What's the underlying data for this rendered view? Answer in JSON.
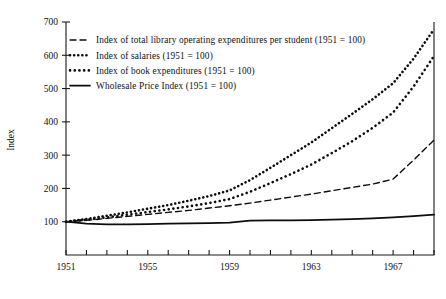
{
  "chart_data": {
    "type": "line",
    "title": "",
    "xlabel": "",
    "ylabel": "Index",
    "xlim": [
      1951,
      1969
    ],
    "ylim": [
      0,
      700
    ],
    "y_ticks": [
      100,
      200,
      300,
      400,
      500,
      600,
      700
    ],
    "x_ticks": [
      1951,
      1952,
      1953,
      1954,
      1955,
      1956,
      1957,
      1958,
      1959,
      1960,
      1961,
      1962,
      1963,
      1964,
      1965,
      1966,
      1967,
      1968,
      1969
    ],
    "x_tick_labels": [
      "1951",
      "",
      "",
      "",
      "1955",
      "",
      "",
      "",
      "1959",
      "",
      "",
      "",
      "1963",
      "",
      "",
      "",
      "1967",
      "",
      ""
    ],
    "grid": false,
    "legend_position": "upper-left",
    "x": [
      1951,
      1952,
      1953,
      1954,
      1955,
      1956,
      1957,
      1958,
      1959,
      1960,
      1961,
      1962,
      1963,
      1964,
      1965,
      1966,
      1967,
      1968,
      1969
    ],
    "series": [
      {
        "name": "Index of total library operating expenditures per student (1951 = 100)",
        "style": "dashed",
        "values": [
          100,
          104,
          110,
          116,
          122,
          128,
          134,
          141,
          148,
          156,
          165,
          174,
          183,
          193,
          203,
          213,
          228,
          285,
          345
        ]
      },
      {
        "name": "Index of salaries (1951 = 100)",
        "style": "dotted-fine",
        "values": [
          100,
          108,
          118,
          128,
          139,
          150,
          163,
          177,
          194,
          225,
          262,
          300,
          338,
          381,
          424,
          468,
          516,
          590,
          678
        ]
      },
      {
        "name": "Index of book expenditures (1951 = 100)",
        "style": "dotted-coarse",
        "values": [
          100,
          106,
          113,
          121,
          129,
          137,
          146,
          156,
          168,
          190,
          216,
          243,
          272,
          306,
          342,
          382,
          428,
          506,
          598
        ]
      },
      {
        "name": "Wholesale Price Index (1951 = 100)",
        "style": "solid",
        "values": [
          100,
          94,
          92,
          92,
          93,
          94,
          95,
          96,
          97,
          103,
          104,
          104,
          105,
          106,
          108,
          110,
          113,
          117,
          121
        ]
      }
    ]
  },
  "legend": {
    "items": [
      {
        "label": "Index of total library operating expenditures per student (1951 = 100)"
      },
      {
        "label": "Index of salaries (1951 = 100)"
      },
      {
        "label": "Index of book expenditures (1951 = 100)"
      },
      {
        "label": "Wholesale Price Index (1951 = 100)"
      }
    ]
  }
}
